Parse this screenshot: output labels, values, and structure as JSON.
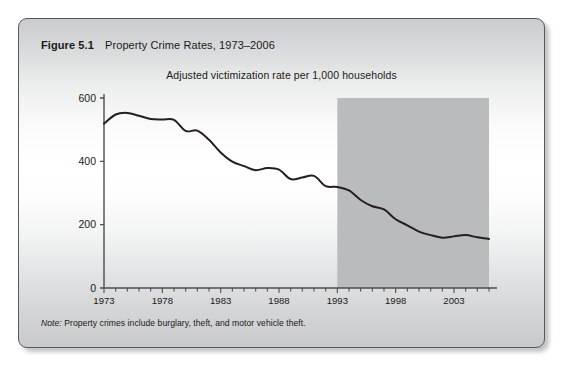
{
  "figure": {
    "number": "Figure 5.1",
    "title": "Property Crime Rates, 1973–2006",
    "note_label": "Note:",
    "note_text": " Property crimes include burglary, theft, and motor vehicle theft."
  },
  "colors": {
    "line": "#231f20",
    "shaded_band": "#b9bbbd",
    "axis": "#4d4d4f",
    "card_border": "#58595b",
    "text": "#1a1a1a"
  },
  "chart_data": {
    "type": "line",
    "title": "Adjusted victimization rate per 1,000 households",
    "xlabel": "",
    "ylabel": "",
    "xlim": [
      1973,
      2006
    ],
    "ylim": [
      0,
      600
    ],
    "yticks": [
      0,
      200,
      400,
      600
    ],
    "ytick_labels": [
      "0",
      "200",
      "400",
      "600"
    ],
    "xticks": [
      1973,
      1978,
      1983,
      1988,
      1993,
      1998,
      2003
    ],
    "xtick_labels": [
      "1973",
      "1978",
      "1983",
      "1988",
      "1993",
      "1998",
      "2003"
    ],
    "xminor_step": 1,
    "grid": false,
    "legend": "none",
    "shaded_region": {
      "x_start": 1993,
      "x_end": 2006,
      "y_start": 0,
      "y_end": 600
    },
    "series": [
      {
        "name": "Adjusted victimization rate per 1,000 households",
        "x": [
          1973,
          1974,
          1975,
          1976,
          1977,
          1978,
          1979,
          1980,
          1981,
          1982,
          1983,
          1984,
          1985,
          1986,
          1987,
          1988,
          1989,
          1990,
          1991,
          1992,
          1993,
          1994,
          1995,
          1996,
          1997,
          1998,
          1999,
          2000,
          2001,
          2002,
          2003,
          2004,
          2005,
          2006
        ],
        "values": [
          519,
          548,
          553,
          544,
          534,
          532,
          531,
          496,
          497,
          468,
          428,
          399,
          385,
          372,
          379,
          374,
          344,
          349,
          354,
          322,
          319,
          308,
          278,
          258,
          248,
          217,
          198,
          178,
          167,
          159,
          163,
          167,
          160,
          155
        ]
      }
    ]
  }
}
